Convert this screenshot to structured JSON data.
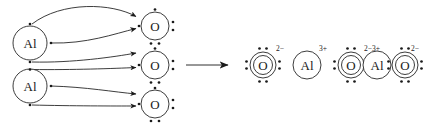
{
  "diagram": {
    "type": "lewis-dot-electron-transfer",
    "reaction_arrow": "→",
    "stroke_color": "#1a1a1a",
    "background_color": "#ffffff",
    "reactants": {
      "label": "reactants",
      "metal_atoms": [
        {
          "symbol": "Al",
          "name": "aluminum-atom",
          "charge": "",
          "valence_electrons": 3,
          "shell_count": 1,
          "cx": 30,
          "cy": 43,
          "r": 17,
          "dot_positions": [
            "top",
            "right",
            "bottom"
          ]
        },
        {
          "symbol": "Al",
          "name": "aluminum-atom",
          "charge": "",
          "valence_electrons": 3,
          "shell_count": 1,
          "cx": 30,
          "cy": 86,
          "r": 17,
          "dot_positions": [
            "top",
            "right",
            "bottom"
          ]
        }
      ],
      "nonmetal_atoms": [
        {
          "symbol": "O",
          "name": "oxygen-atom",
          "charge": "",
          "valence_electrons": 6,
          "shell_count": 1,
          "cx": 155,
          "cy": 26,
          "r": 14,
          "dot_positions": [
            "top",
            "left",
            "right-pair",
            "bottom-pair"
          ]
        },
        {
          "symbol": "O",
          "name": "oxygen-atom",
          "charge": "",
          "valence_electrons": 6,
          "shell_count": 1,
          "cx": 155,
          "cy": 65,
          "r": 14,
          "dot_positions": [
            "top",
            "left",
            "right-pair",
            "bottom-pair"
          ]
        },
        {
          "symbol": "O",
          "name": "oxygen-atom",
          "charge": "",
          "valence_electrons": 6,
          "shell_count": 1,
          "cx": 155,
          "cy": 104,
          "r": 14,
          "dot_positions": [
            "top",
            "left",
            "right-pair",
            "bottom-pair"
          ]
        }
      ],
      "electron_transfer_arrows": [
        {
          "name": "electron-arrow-1",
          "from": "Al-1-top",
          "to": "O-1-top",
          "path": "M 32,24 C 60,2 110,4 136,17"
        },
        {
          "name": "electron-arrow-2",
          "from": "Al-1-right",
          "to": "O-1-left",
          "path": "M 50,43 C 85,43 115,34 137,28"
        },
        {
          "name": "electron-arrow-3",
          "from": "Al-1-bottom",
          "to": "O-2-top",
          "path": "M 32,62 C 70,62 115,56 137,52"
        },
        {
          "name": "electron-arrow-4",
          "from": "Al-2-top",
          "to": "O-2-left",
          "path": "M 32,69 C 70,69 115,68 137,67"
        },
        {
          "name": "electron-arrow-5",
          "from": "Al-2-right",
          "to": "O-3-top",
          "path": "M 50,86 C 85,86 115,92 137,94"
        },
        {
          "name": "electron-arrow-6",
          "from": "Al-2-bottom",
          "to": "O-3-left",
          "path": "M 32,105 C 70,105 115,106 137,106"
        }
      ]
    },
    "products": {
      "label": "products",
      "ions": [
        {
          "symbol": "O",
          "name": "oxide-ion",
          "charge": "2−",
          "ion_type": "anion",
          "shell_count": 2,
          "cx": 263,
          "cy": 65,
          "r": 13,
          "dot_positions": [
            "top-pair",
            "left-pair",
            "right-pair",
            "bottom-pair"
          ]
        },
        {
          "symbol": "Al",
          "name": "aluminum-ion",
          "charge": "3+",
          "ion_type": "cation",
          "shell_count": 1,
          "cx": 307,
          "cy": 65,
          "r": 14,
          "dot_positions": []
        },
        {
          "symbol": "O",
          "name": "oxide-ion",
          "charge": "2−",
          "ion_type": "anion",
          "shell_count": 2,
          "cx": 351,
          "cy": 65,
          "r": 13,
          "dot_positions": [
            "top-pair",
            "left-pair",
            "right-pair",
            "bottom-pair"
          ]
        },
        {
          "symbol": "Al",
          "name": "aluminum-ion",
          "charge": "3+",
          "ion_type": "cation",
          "shell_count": 1,
          "cx": 377,
          "cy": 65,
          "r": 14,
          "dot_positions": []
        },
        {
          "symbol": "O",
          "name": "oxide-ion",
          "charge": "2−",
          "ion_type": "anion",
          "shell_count": 2,
          "cx": 405,
          "cy": 65,
          "r": 13,
          "dot_positions": [
            "top-pair",
            "left-pair",
            "right-pair",
            "bottom-pair"
          ]
        }
      ]
    },
    "labels": {
      "al_1": "Al",
      "al_2": "Al",
      "o_1": "O",
      "o_2": "O",
      "o_3": "O",
      "p_o_1": "O",
      "p_al_1": "Al",
      "p_o_2": "O",
      "p_al_2": "Al",
      "p_o_3": "O",
      "charge_o_1": "2−",
      "charge_al_1": "3+",
      "charge_o_2": "2−",
      "charge_al_2": "3+",
      "charge_o_3": "2−"
    }
  }
}
